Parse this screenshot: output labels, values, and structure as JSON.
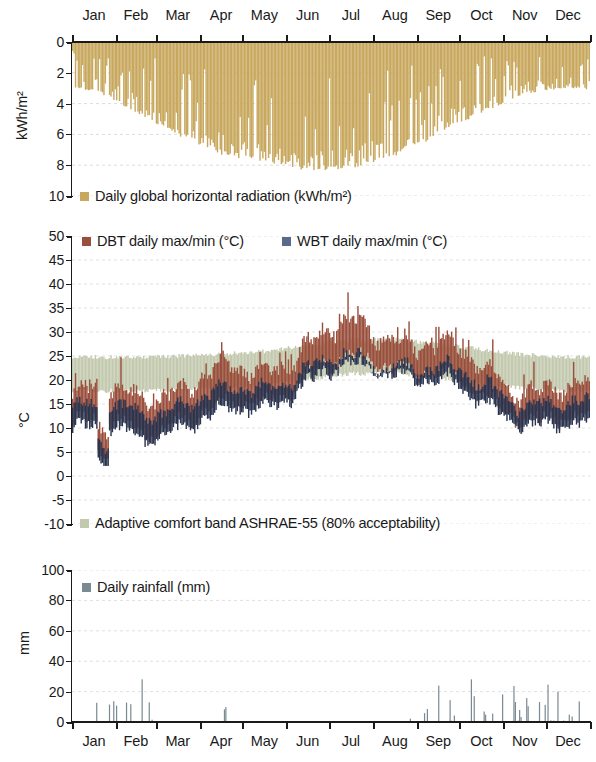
{
  "figure": {
    "width": 596,
    "height": 762,
    "background": "#ffffff"
  },
  "colors": {
    "radiation": "#c8a85e",
    "dbt": "#9a4f3c",
    "wbt": "#2b3550",
    "comfort_band": "#c3c9ae",
    "rainfall": "#7a8a93",
    "axis": "#1a1a1a",
    "gridline": "#d6d6d6"
  },
  "months": [
    "Jan",
    "Feb",
    "Mar",
    "Apr",
    "May",
    "Jun",
    "Jul",
    "Aug",
    "Sep",
    "Oct",
    "Nov",
    "Dec"
  ],
  "chart_data": [
    {
      "id": "radiation",
      "type": "area",
      "title": "",
      "xlabel": "",
      "ylabel": "kWh/m²",
      "ylim": [
        0,
        10
      ],
      "y_inverted": true,
      "yticks": [
        0,
        2,
        4,
        6,
        8,
        10
      ],
      "ytick_labels": [
        "0",
        "2",
        "4",
        "6",
        "8",
        "10"
      ],
      "grid": true,
      "legend": [
        {
          "label": "Daily global horizontal radiation (kWh/m²)",
          "color": "#c8a85e"
        }
      ],
      "x": "day-of-year 1..365",
      "x_tick_labels": [
        "Jan",
        "Feb",
        "Mar",
        "Apr",
        "May",
        "Jun",
        "Jul",
        "Aug",
        "Sep",
        "Oct",
        "Nov",
        "Dec"
      ],
      "x_tick_position": "top",
      "monthly_mean_values": [
        2.3,
        3.3,
        4.6,
        5.8,
        6.5,
        7.0,
        6.8,
        6.0,
        4.6,
        3.4,
        2.5,
        2.1
      ],
      "monthly_peak_values": [
        3.2,
        4.6,
        6.1,
        7.4,
        7.8,
        8.4,
        8.2,
        7.4,
        6.1,
        4.6,
        3.4,
        3.0
      ],
      "annual_min": 0.4,
      "annual_max": 8.6,
      "units": "kWh/m²",
      "note": "Daily totals; shaded downward from 0, deepest in mid-summer (Jun-Aug)."
    },
    {
      "id": "temperature",
      "type": "area",
      "title": "",
      "xlabel": "",
      "ylabel": "°C",
      "ylim": [
        -10,
        50
      ],
      "y_inverted": false,
      "yticks": [
        -10,
        -5,
        0,
        5,
        10,
        15,
        20,
        25,
        30,
        35,
        40,
        45,
        50
      ],
      "ytick_labels": [
        "-10",
        "-5",
        "0",
        "5",
        "10",
        "15",
        "20",
        "25",
        "30",
        "35",
        "40",
        "45",
        "50"
      ],
      "grid": true,
      "legend": [
        {
          "label": "DBT daily max/min (°C)",
          "color": "#9a4f3c"
        },
        {
          "label": "WBT daily max/min (°C)",
          "color": "#2b3550"
        },
        {
          "label": "Adaptive comfort band ASHRAE-55 (80% acceptability)",
          "color": "#c3c9ae"
        }
      ],
      "x": "day-of-year 1..365",
      "x_tick_labels": [
        "Jan",
        "Feb",
        "Mar",
        "Apr",
        "May",
        "Jun",
        "Jul",
        "Aug",
        "Sep",
        "Oct",
        "Nov",
        "Dec"
      ],
      "series": [
        {
          "name": "DBT daily max (°C)",
          "color": "#9a4f3c",
          "monthly_values": [
            16.5,
            17.0,
            18.5,
            20.5,
            23.0,
            27.5,
            30.5,
            30.0,
            26.5,
            22.5,
            19.0,
            17.0
          ]
        },
        {
          "name": "DBT daily min (°C)",
          "color": "#9a4f3c",
          "monthly_values": [
            10.5,
            10.0,
            11.5,
            13.5,
            16.5,
            21.0,
            24.0,
            24.0,
            21.0,
            16.5,
            13.0,
            11.0
          ]
        },
        {
          "name": "WBT daily max (°C)",
          "color": "#2b3550",
          "monthly_values": [
            13.5,
            13.5,
            15.0,
            16.5,
            19.0,
            22.5,
            24.0,
            24.0,
            22.0,
            19.0,
            16.0,
            14.0
          ]
        },
        {
          "name": "WBT daily min (°C)",
          "color": "#2b3550",
          "monthly_values": [
            8.5,
            8.0,
            9.5,
            11.0,
            14.0,
            18.5,
            21.0,
            21.0,
            18.5,
            14.5,
            11.0,
            9.0
          ]
        },
        {
          "name": "Adaptive comfort band upper (°C)",
          "color": "#c3c9ae",
          "monthly_values": [
            24.8,
            24.6,
            25.0,
            25.4,
            26.0,
            27.2,
            28.3,
            28.4,
            27.6,
            26.3,
            25.2,
            24.8
          ]
        },
        {
          "name": "Adaptive comfort band lower (°C)",
          "color": "#c3c9ae",
          "monthly_values": [
            17.8,
            17.6,
            18.0,
            18.4,
            19.0,
            20.2,
            21.3,
            21.4,
            20.6,
            19.3,
            18.2,
            17.8
          ]
        }
      ],
      "annual_max_dbt": 38.5,
      "annual_min_dbt": 3.6,
      "units": "°C"
    },
    {
      "id": "rainfall",
      "type": "bar",
      "title": "",
      "xlabel": "",
      "ylabel": "mm",
      "ylim": [
        0,
        100
      ],
      "y_inverted": false,
      "yticks": [
        0,
        20,
        40,
        60,
        80,
        100
      ],
      "ytick_labels": [
        "0",
        "20",
        "40",
        "60",
        "80",
        "100"
      ],
      "grid": true,
      "legend": [
        {
          "label": "Daily rainfall (mm)",
          "color": "#7a8a93"
        }
      ],
      "x": "day-of-year 1..365",
      "x_tick_labels": [
        "Jan",
        "Feb",
        "Mar",
        "Apr",
        "May",
        "Jun",
        "Jul",
        "Aug",
        "Sep",
        "Oct",
        "Nov",
        "Dec"
      ],
      "x_tick_position": "bottom",
      "monthly_totals": [
        62,
        58,
        34,
        24,
        4,
        9,
        0,
        3,
        52,
        74,
        68,
        70
      ],
      "monthly_max_daily": [
        26,
        29,
        18,
        10,
        2,
        8,
        0,
        3,
        34,
        37,
        36,
        30
      ],
      "annual_max_daily": 37,
      "units": "mm",
      "notable_events": [
        {
          "month": "Jan",
          "value": 26
        },
        {
          "month": "Feb",
          "value": 29
        },
        {
          "month": "Mar",
          "value": 18
        },
        {
          "month": "Sep",
          "value": 34
        },
        {
          "month": "Oct",
          "value": 37
        },
        {
          "month": "Oct",
          "value": 15
        },
        {
          "month": "Nov",
          "value": 36
        },
        {
          "month": "Dec",
          "value": 30
        }
      ]
    }
  ]
}
